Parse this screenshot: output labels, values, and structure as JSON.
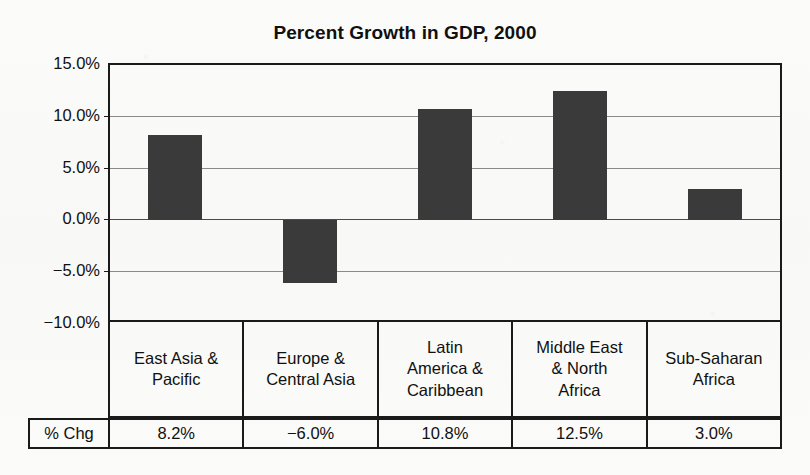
{
  "chart_data": {
    "type": "bar",
    "title": "Percent Growth in GDP, 2000",
    "xlabel": "",
    "ylabel": "",
    "ylim": [
      -10.0,
      15.0
    ],
    "grid": true,
    "legend": "none",
    "categories": [
      "East Asia & Pacific",
      "Europe & Central Asia",
      "Latin America & Caribbean",
      "Middle East & North Africa",
      "Sub-Saharan Africa"
    ],
    "values": [
      8.2,
      -6.0,
      10.8,
      12.5,
      3.0
    ],
    "value_labels": [
      "8.2%",
      "−6.0%",
      "10.8%",
      "12.5%",
      "3.0%"
    ],
    "ytick_values": [
      15.0,
      10.0,
      5.0,
      0.0,
      -5.0,
      -10.0
    ],
    "ytick_labels": [
      "15.0%",
      "10.0%",
      "5.0%",
      "0.0%",
      "−5.0%",
      "−10.0%"
    ],
    "series_row_label": "% Chg",
    "bar_color": "#3a3a3a",
    "axis_color": "#1a1a1a",
    "grid_color": "#8a8a8a"
  },
  "category_lines": [
    [
      "East Asia &",
      "Pacific"
    ],
    [
      "Europe &",
      "Central Asia"
    ],
    [
      "Latin",
      "America &",
      "Caribbean"
    ],
    [
      "Middle East",
      "& North",
      "Africa"
    ],
    [
      "Sub-Saharan",
      "Africa"
    ]
  ]
}
